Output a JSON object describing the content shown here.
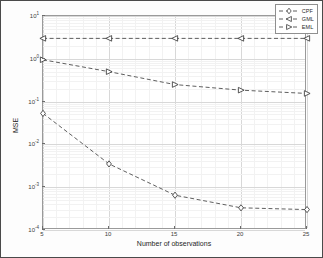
{
  "chart_data": {
    "type": "line",
    "title": "",
    "xlabel": "Number of observations",
    "ylabel": "MSE",
    "x": [
      5,
      10,
      15,
      20,
      25
    ],
    "xlim": [
      5,
      25
    ],
    "ylim": [
      0.0001,
      10
    ],
    "yscale": "log",
    "xscale": "linear",
    "grid": true,
    "legend_position": "top-right",
    "xticks": [
      "5",
      "10",
      "15",
      "20",
      "25"
    ],
    "yticks": [
      "10^-4",
      "10^-3",
      "10^-2",
      "10^-1",
      "10^0",
      "10^1"
    ],
    "series": [
      {
        "name": "CPF",
        "marker": "diamond",
        "linestyle": "dashed",
        "values": [
          0.053,
          0.0035,
          0.00065,
          0.00033,
          0.0003
        ]
      },
      {
        "name": "GML",
        "marker": "left-triangle",
        "linestyle": "dashed",
        "values": [
          3.0,
          3.0,
          3.0,
          3.0,
          3.0
        ]
      },
      {
        "name": "EML",
        "marker": "right-triangle",
        "linestyle": "dashed",
        "values": [
          0.95,
          0.5,
          0.25,
          0.185,
          0.155
        ]
      }
    ]
  },
  "axes": {
    "y_tick_labels": [
      {
        "mantissa": "10",
        "exp": "1"
      },
      {
        "mantissa": "10",
        "exp": "0"
      },
      {
        "mantissa": "10",
        "exp": "-1"
      },
      {
        "mantissa": "10",
        "exp": "-2"
      },
      {
        "mantissa": "10",
        "exp": "-3"
      },
      {
        "mantissa": "10",
        "exp": "-4"
      }
    ],
    "x_tick_labels": [
      "5",
      "10",
      "15",
      "20",
      "25"
    ],
    "x_axis_title": "Number of observations",
    "y_axis_title": "MSE"
  },
  "legend": {
    "items": [
      {
        "label": "CPF",
        "marker": "diamond"
      },
      {
        "label": "GML",
        "marker": "left-triangle"
      },
      {
        "label": "EML",
        "marker": "right-triangle"
      }
    ]
  },
  "colors": {
    "line": "#4d4d4d",
    "marker_fill": "#ffffff",
    "marker_edge": "#3a3a3a",
    "grid_major": "#d8d8d8",
    "grid_minor": "#f2f2f2",
    "axis": "#9a9a9a",
    "text": "#2a2a2a",
    "figure_border": "#4a4a4a",
    "background": "#ffffff"
  }
}
